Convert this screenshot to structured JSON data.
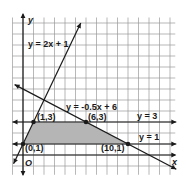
{
  "chart_data": {
    "type": "line",
    "title": "",
    "xlabel": "x",
    "ylabel": "y",
    "origin_label": "O",
    "xlim": [
      -1,
      14.5
    ],
    "ylim": [
      -1.8,
      12.5
    ],
    "grid": true,
    "feasible_region": {
      "vertices": [
        [
          0,
          1
        ],
        [
          1,
          3
        ],
        [
          6,
          3
        ],
        [
          10,
          1
        ]
      ],
      "fill": "#b5b5b5"
    },
    "lines": [
      {
        "name": "y = 2x + 1",
        "kind": "slope",
        "m": 2,
        "b": 1,
        "label": "y = 2x + 1",
        "x_range": [
          -0.9,
          5.5
        ],
        "arrows": "both"
      },
      {
        "name": "y = -0.5x + 6",
        "kind": "slope",
        "m": -0.5,
        "b": 6,
        "label": "y = -0.5x + 6",
        "x_range": [
          -0.8,
          14.6
        ],
        "arrows": "both"
      },
      {
        "name": "y = 3",
        "kind": "horizontal",
        "y": 3,
        "label": "y = 3",
        "x_range": [
          -1.0,
          14.6
        ],
        "arrows": "both"
      },
      {
        "name": "y = 1",
        "kind": "horizontal",
        "y": 1,
        "label": "y = 1",
        "x_range": [
          -1.0,
          14.6
        ],
        "arrows": "both"
      }
    ],
    "points": [
      {
        "x": 0,
        "y": 1,
        "label": "(0,1)"
      },
      {
        "x": 1,
        "y": 3,
        "label": "(1,3)"
      },
      {
        "x": 6,
        "y": 3,
        "label": "(6,3)"
      },
      {
        "x": 10,
        "y": 1,
        "label": "(10,1)"
      }
    ],
    "colors": {
      "grid": "#9a9a9a",
      "line": "#1a1a1a",
      "region": "#b5b5b5"
    }
  }
}
